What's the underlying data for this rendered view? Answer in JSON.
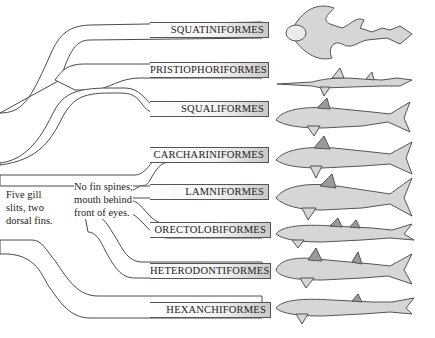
{
  "diagram": {
    "type": "cladogram",
    "orders": [
      {
        "label": "SQUATINIFORMES",
        "animal": "angel shark"
      },
      {
        "label": "PRISTIOPHORIFORMES",
        "animal": "sawshark"
      },
      {
        "label": "SQUALIFORMES",
        "animal": "dogfish shark"
      },
      {
        "label": "CARCHARINIFORMES",
        "animal": "ground shark"
      },
      {
        "label": "LAMNIFORMES",
        "animal": "mackerel shark"
      },
      {
        "label": "ORECTOLOBIFORMES",
        "animal": "carpet shark"
      },
      {
        "label": "HETERODONTIFORMES",
        "animal": "bullhead shark"
      },
      {
        "label": "HEXANCHIFORMES",
        "animal": "six/seven-gill shark"
      }
    ],
    "annotations": {
      "five_gill": [
        "Five gill",
        "slits, two",
        "dorsal fins."
      ],
      "no_fin_spines": [
        "No fin spines;",
        "mouth behind",
        "front of eyes."
      ]
    },
    "colors": {
      "line": "#4a4a4a",
      "branch_fill": "#ffffff",
      "label_shade": "#c9c9c9",
      "fish_fill": "#d6d6d6",
      "fish_dark": "#8a8a8a"
    }
  }
}
